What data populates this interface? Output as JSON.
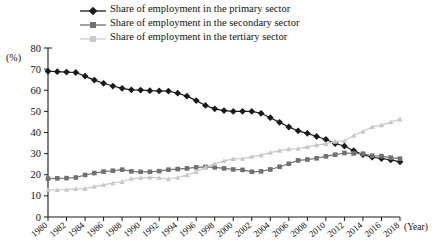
{
  "legend": {
    "position": "top",
    "items": [
      {
        "label": "Share of employment in the primary sector",
        "color": "#1a1a1a",
        "marker": "diamond-marker"
      },
      {
        "label": "Share of employment in the secondary sector",
        "color": "#707070",
        "marker": "square-marker"
      },
      {
        "label": "Share of employment in the tertiary sector",
        "color": "#c8c8c8",
        "marker": "triangle-marker"
      }
    ]
  },
  "axes": {
    "y_unit": "(%)",
    "x_unit": "(Year)",
    "y_ticks": [
      0,
      10,
      20,
      30,
      40,
      50,
      60,
      70,
      80
    ],
    "x_ticks": [
      1980,
      1982,
      1984,
      1986,
      1988,
      1990,
      1992,
      1994,
      1996,
      1998,
      2000,
      2002,
      2004,
      2006,
      2008,
      2010,
      2012,
      2014,
      2016,
      2018
    ]
  },
  "chart_data": {
    "type": "line",
    "title": "",
    "xlabel": "(Year)",
    "ylabel": "(%)",
    "xlim": [
      1980,
      2018
    ],
    "ylim": [
      0,
      80
    ],
    "grid": false,
    "legend_position": "top",
    "x": [
      1980,
      1981,
      1982,
      1983,
      1984,
      1985,
      1986,
      1987,
      1988,
      1989,
      1990,
      1991,
      1992,
      1993,
      1994,
      1995,
      1996,
      1997,
      1998,
      1999,
      2000,
      2001,
      2002,
      2003,
      2004,
      2005,
      2006,
      2007,
      2008,
      2009,
      2010,
      2011,
      2012,
      2013,
      2014,
      2015,
      2016,
      2017,
      2018
    ],
    "series": [
      {
        "name": "Share of employment in the primary sector",
        "color": "#1a1a1a",
        "marker": "diamond",
        "values": [
          69.0,
          68.8,
          68.6,
          68.4,
          66.7,
          64.8,
          63.3,
          62.0,
          60.9,
          60.2,
          60.1,
          59.8,
          59.7,
          59.6,
          58.6,
          57.2,
          55.1,
          52.8,
          51.2,
          50.4,
          50.0,
          50.0,
          50.0,
          49.1,
          47.0,
          44.8,
          42.6,
          40.8,
          39.6,
          38.1,
          36.7,
          34.8,
          33.6,
          31.4,
          29.5,
          28.3,
          27.7,
          27.0,
          26.1
        ]
      },
      {
        "name": "Share of employment in the secondary sector",
        "color": "#707070",
        "marker": "square",
        "values": [
          18.2,
          18.3,
          18.4,
          18.7,
          19.9,
          20.8,
          21.5,
          21.9,
          22.4,
          21.6,
          21.4,
          21.4,
          21.7,
          22.4,
          22.7,
          23.0,
          23.5,
          23.7,
          23.5,
          23.0,
          22.5,
          22.3,
          21.4,
          21.6,
          22.5,
          23.8,
          25.2,
          26.8,
          27.2,
          27.8,
          28.7,
          29.5,
          30.3,
          30.1,
          29.9,
          29.0,
          28.8,
          28.1,
          27.6
        ]
      },
      {
        "name": "Share of employment in the tertiary sector",
        "color": "#c8c8c8",
        "marker": "triangle",
        "values": [
          12.8,
          12.9,
          13.0,
          13.3,
          13.4,
          14.4,
          15.2,
          16.1,
          16.7,
          18.2,
          18.5,
          18.8,
          18.6,
          18.0,
          18.7,
          19.8,
          21.4,
          23.5,
          25.3,
          26.6,
          27.5,
          27.7,
          28.6,
          29.3,
          30.5,
          31.4,
          32.2,
          32.4,
          33.2,
          34.1,
          34.6,
          35.7,
          36.1,
          38.5,
          40.6,
          42.7,
          43.5,
          44.9,
          46.3
        ]
      }
    ]
  }
}
